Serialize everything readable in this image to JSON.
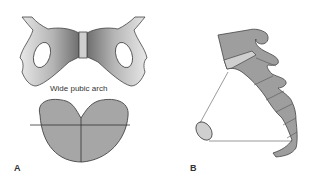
{
  "figure": {
    "panel_a": {
      "letter": "A",
      "caption": "Wide pubic arch",
      "elements": [
        "pelvis-front-view",
        "pelvic-inlet-outline"
      ]
    },
    "panel_b": {
      "letter": "B",
      "elements": [
        "sacrum-coccyx-lateral-view",
        "pelvic-inlet-ellipse",
        "measurement-lines"
      ]
    },
    "colors": {
      "bone_dark": "#8a8a8a",
      "bone_light": "#d9d9d9",
      "fill_mid": "#a6a6a6",
      "outline": "#444444",
      "symphysis": "#cfcfcf"
    }
  }
}
